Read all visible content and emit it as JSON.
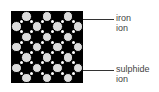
{
  "diagram": {
    "grid": {
      "rows": 7,
      "cols": 7,
      "first_cell": "black"
    },
    "labels": [
      {
        "id": "iron",
        "line1": "iron",
        "line2": "ion",
        "points_to_row": 1
      },
      {
        "id": "sulphide",
        "line1": "sulphide",
        "line2": "ion",
        "points_to_row": 6
      }
    ],
    "colors": {
      "iron_ion": "#000000",
      "sulphide_ion": "#dcdcdc"
    }
  }
}
